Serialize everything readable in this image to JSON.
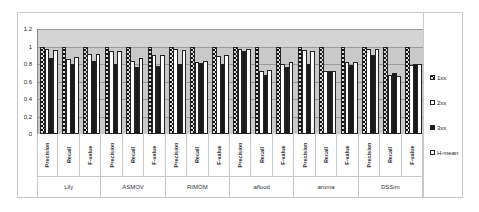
{
  "chart_data": {
    "type": "bar",
    "title": "",
    "xlabel": "",
    "ylabel": "",
    "ylim": [
      0,
      1.2
    ],
    "yticks": [
      "0",
      "0.2",
      "0.4",
      "0.6",
      "0.8",
      "1",
      "1.2"
    ],
    "grid": true,
    "legend_position": "right",
    "groups": [
      "Lily",
      "ASMOV",
      "RIMOM",
      "aflood",
      "aroma",
      "DSSim"
    ],
    "metrics": [
      "Precision",
      "Recall",
      "F-value"
    ],
    "categories": [
      "Lily Precision",
      "Lily Recall",
      "Lily F-value",
      "ASMOV Precision",
      "ASMOV Recall",
      "ASMOV F-value",
      "RIMOM Precision",
      "RIMOM Recall",
      "RIMOM F-value",
      "aflood Precision",
      "aflood Recall",
      "aflood F-value",
      "aroma Precision",
      "aroma Recall",
      "aroma F-value",
      "DSSim Precision",
      "DSSim Recall",
      "DSSim F-value"
    ],
    "series": [
      {
        "name": "1xx",
        "values": [
          1.0,
          1.0,
          1.0,
          1.0,
          1.0,
          1.0,
          1.0,
          1.0,
          1.0,
          1.0,
          1.0,
          1.0,
          1.0,
          1.0,
          1.0,
          1.0,
          1.0,
          1.0
        ]
      },
      {
        "name": "2xx",
        "values": [
          0.97,
          0.86,
          0.91,
          0.95,
          0.84,
          0.9,
          0.97,
          0.82,
          0.89,
          0.97,
          0.72,
          0.8,
          0.96,
          0.72,
          0.82,
          0.97,
          0.68,
          0.79
        ]
      },
      {
        "name": "3xx",
        "values": [
          0.87,
          0.8,
          0.84,
          0.8,
          0.77,
          0.78,
          0.8,
          0.81,
          0.8,
          0.95,
          0.67,
          0.77,
          0.8,
          0.72,
          0.79,
          0.9,
          0.7,
          0.8
        ]
      },
      {
        "name": "H-mean",
        "values": [
          0.96,
          0.88,
          0.92,
          0.95,
          0.87,
          0.9,
          0.96,
          0.83,
          0.9,
          0.97,
          0.73,
          0.82,
          0.95,
          0.72,
          0.82,
          0.97,
          0.66,
          0.8
        ]
      }
    ]
  },
  "legend": {
    "items": [
      {
        "label": "1xx"
      },
      {
        "label": "2xx"
      },
      {
        "label": "3xx"
      },
      {
        "label": "H-mean"
      }
    ]
  }
}
